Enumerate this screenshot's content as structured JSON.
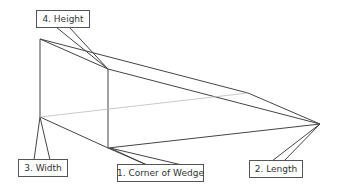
{
  "diagram": {
    "title": "",
    "type": "wedge-dimensions",
    "labels": [
      {
        "id": "height",
        "text": "4. Height"
      },
      {
        "id": "width",
        "text": "3. Width"
      },
      {
        "id": "corner",
        "text": "1. Corner of Wedge"
      },
      {
        "id": "length",
        "text": "2. Length"
      }
    ],
    "colors": {
      "line": "#444444",
      "hidden_line": "#bbbbbb",
      "label_border": "#555555",
      "text": "#333333"
    }
  }
}
